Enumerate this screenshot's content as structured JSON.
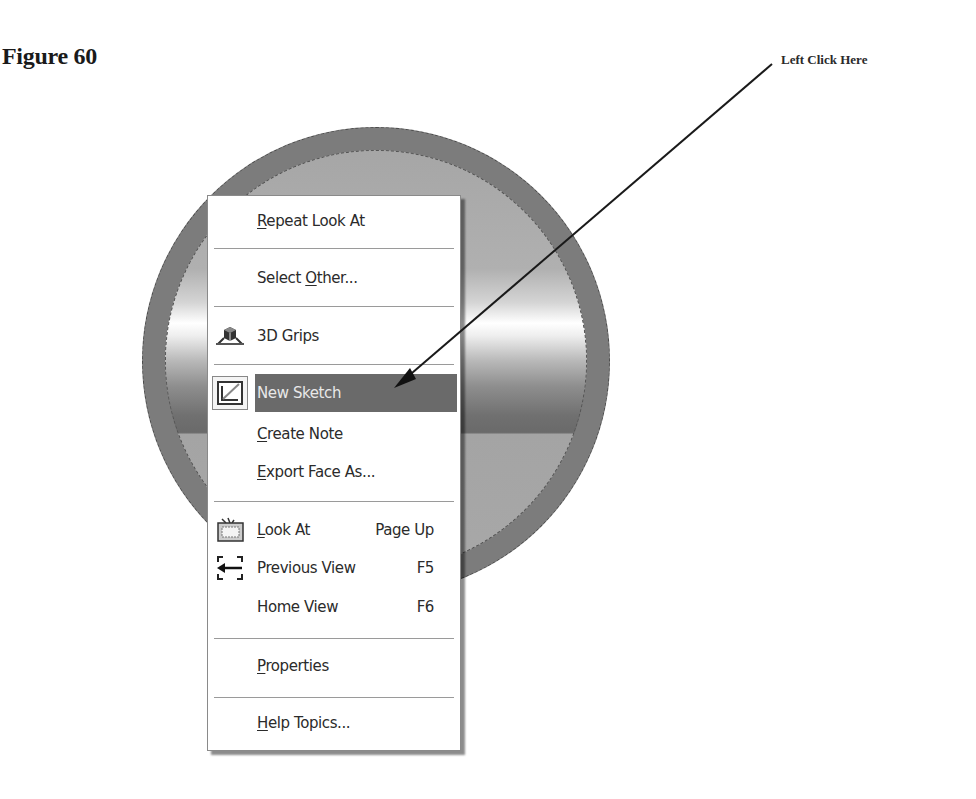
{
  "figure": {
    "title": "Figure 60",
    "callout": "Left Click Here"
  },
  "context_menu": {
    "items": [
      {
        "id": "repeat-look-at",
        "label": "Repeat Look At",
        "mnemonic": "R",
        "shortcut": "",
        "icon": null,
        "highlighted": false
      },
      {
        "id": "select-other",
        "label": "Select Other...",
        "mnemonic": "O",
        "shortcut": "",
        "icon": null,
        "highlighted": false
      },
      {
        "id": "3d-grips",
        "label": "3D Grips",
        "mnemonic": "",
        "shortcut": "",
        "icon": "3d-grips-icon",
        "highlighted": false
      },
      {
        "id": "new-sketch",
        "label": "New Sketch",
        "mnemonic": "",
        "shortcut": "",
        "icon": "new-sketch-icon",
        "highlighted": true
      },
      {
        "id": "create-note",
        "label": "Create Note",
        "mnemonic": "C",
        "shortcut": "",
        "icon": null,
        "highlighted": false
      },
      {
        "id": "export-face-as",
        "label": "Export Face As...",
        "mnemonic": "E",
        "shortcut": "",
        "icon": null,
        "highlighted": false
      },
      {
        "id": "look-at",
        "label": "Look At",
        "mnemonic": "L",
        "shortcut": "Page Up",
        "icon": "look-at-icon",
        "highlighted": false
      },
      {
        "id": "previous-view",
        "label": "Previous View",
        "mnemonic": "",
        "shortcut": "F5",
        "icon": "previous-view-icon",
        "highlighted": false
      },
      {
        "id": "home-view",
        "label": "Home View",
        "mnemonic": "",
        "shortcut": "F6",
        "icon": null,
        "highlighted": false
      },
      {
        "id": "properties",
        "label": "Properties",
        "mnemonic": "P",
        "shortcut": "",
        "icon": null,
        "highlighted": false
      },
      {
        "id": "help-topics",
        "label": "Help Topics...",
        "mnemonic": "H",
        "shortcut": "",
        "icon": null,
        "highlighted": false
      }
    ],
    "labels": {
      "repeat_pre": "",
      "repeat_u": "R",
      "repeat_post": "epeat Look At",
      "select_pre": "Select ",
      "select_u": "O",
      "select_post": "ther...",
      "grips": "3D Grips",
      "new_sketch": "New Sketch",
      "note_u": "C",
      "note_post": "reate Note",
      "export_u": "E",
      "export_post": "xport Face As...",
      "look_u": "L",
      "look_post": "ook At",
      "look_key": "Page Up",
      "prev": "Previous View",
      "prev_key": "F5",
      "home": "Home View",
      "home_key": "F6",
      "props_u": "P",
      "props_post": "roperties",
      "help_u": "H",
      "help_post": "elp Topics..."
    }
  },
  "colors": {
    "highlight": "#6a6a6a",
    "disc_rim": "#7c7c7c",
    "menu_bg": "#ffffff"
  }
}
